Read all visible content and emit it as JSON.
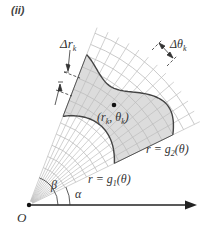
{
  "panel_label": "(ii)",
  "labels": {
    "delta_r": "Δr",
    "delta_r_sub": "k",
    "delta_theta": "Δθ",
    "delta_theta_sub": "k",
    "point_open": "(r",
    "point_sub_r": "k",
    "point_comma": ", θ",
    "point_sub_theta": "k",
    "point_close": ")",
    "g2": "r = g",
    "g2_sub": "2",
    "g2_tail": "(θ)",
    "g1": "r = g",
    "g1_sub": "1",
    "g1_tail": "(θ)",
    "beta": "β",
    "alpha": "α",
    "origin": "O"
  },
  "geometry": {
    "origin": [
      29,
      205
    ],
    "alpha_deg": 26,
    "beta_deg": 69,
    "outer_radius": 190,
    "grid_line_color": "#bdbdbd",
    "shade_color": "#dcdcdc",
    "curve_color": "#444444"
  }
}
